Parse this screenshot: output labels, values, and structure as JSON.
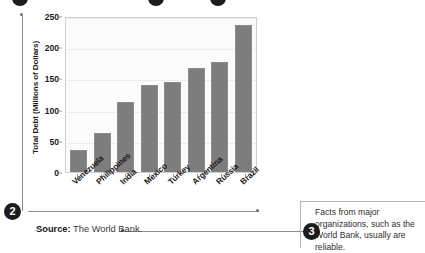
{
  "chart_data": {
    "type": "bar",
    "title": "",
    "xlabel": "",
    "ylabel": "Total Debt (Millions of Dollars)",
    "categories": [
      "Venezuela",
      "Philippines",
      "India",
      "Mexico",
      "Turkey",
      "Argentina",
      "Russia",
      "Brazil"
    ],
    "values": [
      35,
      62,
      112,
      140,
      145,
      166,
      176,
      236
    ],
    "ylim": [
      0,
      250
    ],
    "y_ticks": [
      0,
      50,
      100,
      150,
      200,
      250
    ],
    "grid": true,
    "legend": "none",
    "bar_color": "#7d7d7d",
    "plot_background": "#fbfbfb"
  },
  "source": {
    "label": "Source:",
    "value": "The World Bank."
  },
  "annotations": {
    "marker_2": "2",
    "marker_3": "3",
    "callout_3_text": "Facts from major organizations, such as the World Bank, usually are reliable."
  }
}
